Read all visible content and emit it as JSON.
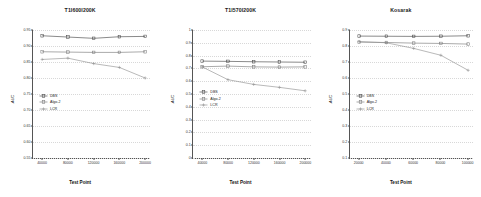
{
  "figure": {
    "axis_x_label": "Test Point",
    "axis_y_label": "AUC",
    "series_names": [
      "DBS",
      "Algo-2",
      "LCR"
    ],
    "series_colors": [
      "#3a3a3a",
      "#707070",
      "#8a8a8a"
    ]
  },
  "chart_data": [
    {
      "type": "line",
      "title": "T1I600I200K",
      "xlabel": "Test Point",
      "ylabel": "AUC",
      "x": [
        40000,
        80000,
        120000,
        160000,
        200000
      ],
      "xtick_labels": [
        "40000",
        "80000",
        "120000",
        "160000",
        "200000"
      ],
      "ylim": [
        0.55,
        0.95
      ],
      "yticks": [
        0.55,
        0.6,
        0.65,
        0.7,
        0.75,
        0.8,
        0.85,
        0.9,
        0.95
      ],
      "ytick_labels": [
        "0.55",
        "0.60",
        "0.65",
        "0.70",
        "0.75",
        "0.80",
        "0.85",
        "0.90",
        "0.95"
      ],
      "grid": true,
      "legend_position": "center-left",
      "series": [
        {
          "name": "DBS",
          "values": [
            0.932,
            0.928,
            0.924,
            0.929,
            0.93
          ]
        },
        {
          "name": "Algo-2",
          "values": [
            0.882,
            0.881,
            0.88,
            0.88,
            0.882
          ]
        },
        {
          "name": "LCR",
          "values": [
            0.858,
            0.862,
            0.845,
            0.833,
            0.8
          ]
        }
      ]
    },
    {
      "type": "line",
      "title": "T1I570I200K",
      "xlabel": "Test Point",
      "ylabel": "AUC",
      "x": [
        40000,
        80000,
        120000,
        160000,
        200000
      ],
      "xtick_labels": [
        "40000",
        "80000",
        "120000",
        "160000",
        "200000"
      ],
      "ylim": [
        0.0,
        1.0
      ],
      "yticks": [
        0.0,
        0.1,
        0.2,
        0.3,
        0.4,
        0.5,
        0.6,
        0.7,
        0.8,
        0.9,
        1.0
      ],
      "ytick_labels": [
        "0",
        "0.1",
        "0.2",
        "0.3",
        "0.4",
        "0.5",
        "0.6",
        "0.7",
        "0.8",
        "0.9",
        "1"
      ],
      "grid": true,
      "legend_position": "center-left",
      "series": [
        {
          "name": "DBS",
          "values": [
            0.757,
            0.755,
            0.752,
            0.75,
            0.748
          ]
        },
        {
          "name": "Algo-2",
          "values": [
            0.713,
            0.718,
            0.712,
            0.71,
            0.712
          ]
        },
        {
          "name": "LCR",
          "values": [
            0.712,
            0.612,
            0.575,
            0.552,
            0.525
          ]
        }
      ]
    },
    {
      "type": "line",
      "title": "Kosarak",
      "xlabel": "Test Point",
      "ylabel": "AUC",
      "x": [
        20000,
        40000,
        60000,
        80000,
        100000
      ],
      "xtick_labels": [
        "20000",
        "40000",
        "60000",
        "80000",
        "100000"
      ],
      "ylim": [
        0.1,
        0.9
      ],
      "yticks": [
        0.1,
        0.2,
        0.3,
        0.4,
        0.5,
        0.6,
        0.7,
        0.8,
        0.9
      ],
      "ytick_labels": [
        "0.1",
        "0.2",
        "0.3",
        "0.4",
        "0.5",
        "0.6",
        "0.7",
        "0.8",
        "0.9"
      ],
      "grid": true,
      "legend_position": "center-left",
      "series": [
        {
          "name": "DBS",
          "values": [
            0.862,
            0.861,
            0.86,
            0.861,
            0.864
          ]
        },
        {
          "name": "Algo-2",
          "values": [
            0.824,
            0.822,
            0.818,
            0.816,
            0.812
          ]
        },
        {
          "name": "LCR",
          "values": [
            0.828,
            0.82,
            0.785,
            0.742,
            0.648
          ]
        }
      ]
    }
  ]
}
